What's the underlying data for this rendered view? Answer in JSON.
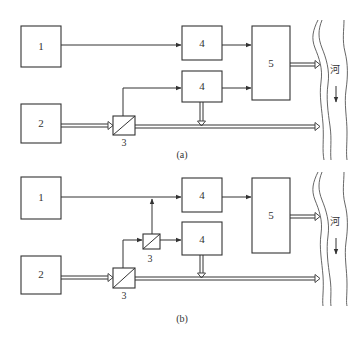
{
  "figure": {
    "diagrams": [
      {
        "id": "a",
        "caption": "(a)",
        "boxes": {
          "source1": "1",
          "source2": "2",
          "splitter": "3",
          "unit4_top": "4",
          "unit4_bottom": "4",
          "unit5": "5"
        },
        "river_label": "河"
      },
      {
        "id": "b",
        "caption": "(b)",
        "boxes": {
          "source1": "1",
          "source2": "2",
          "splitter_main": "3",
          "splitter_secondary": "3",
          "unit4_top": "4",
          "unit4_bottom": "4",
          "unit5": "5"
        },
        "river_label": "河"
      }
    ]
  },
  "colors": {
    "stroke": "#333333",
    "background": "#ffffff"
  }
}
